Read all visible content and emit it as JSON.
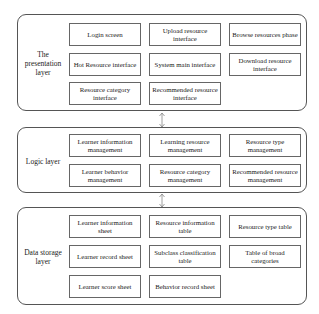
{
  "layers": [
    {
      "label": "The presentation layer",
      "boxes": [
        "Login screen",
        "Upload resource interface",
        "Browse resources phase",
        "Hot Resource interface",
        "System main interface",
        "Download resource interface",
        "Resource category interface",
        "Recommended resource interface"
      ]
    },
    {
      "label": "Logic layer",
      "boxes": [
        "Learner information management",
        "Learning resource management",
        "Resource type management",
        "Learner behavior management",
        "Resource category management",
        "Recommended resource management"
      ]
    },
    {
      "label": "Data storage layer",
      "boxes": [
        "Learner information sheet",
        "Resource information table",
        "Resource type table",
        "Learner record sheet",
        "Subclass classification table",
        "Table of broad categories",
        "Learner score sheet",
        "Behavior record sheet"
      ]
    }
  ],
  "arrows": [
    {
      "from": "The presentation layer",
      "to": "Logic layer",
      "type": "bidirectional"
    },
    {
      "from": "Logic layer",
      "to": "Data storage layer",
      "type": "bidirectional"
    }
  ]
}
